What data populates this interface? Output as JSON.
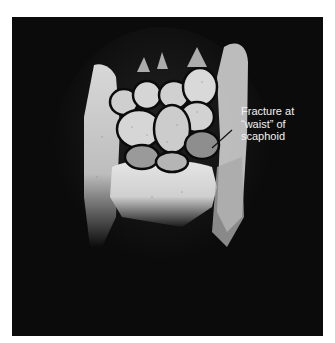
{
  "figure": {
    "annotation": {
      "lines": [
        "Fracture at",
        "“waist” of",
        "scaphoid"
      ],
      "text_color": "#f2f2f2",
      "pointer_color": "#111111"
    },
    "background_color": "#0b0b0b"
  }
}
